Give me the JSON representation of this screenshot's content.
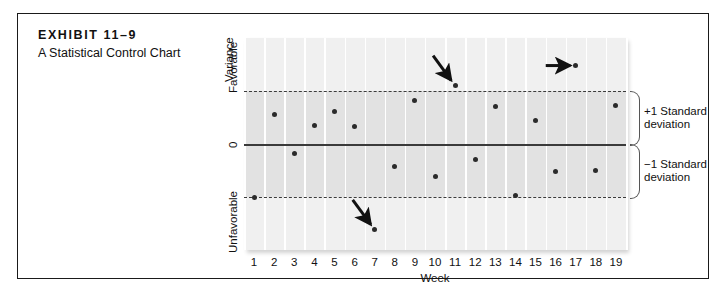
{
  "exhibit": {
    "title": "EXHIBIT 11–9",
    "subtitle": "A Statistical Control Chart"
  },
  "chart_data": {
    "type": "scatter",
    "title": "A Statistical Control Chart",
    "xlabel": "Week",
    "ylabel": "Variance",
    "categories": [
      1,
      2,
      3,
      4,
      5,
      6,
      7,
      8,
      9,
      10,
      11,
      12,
      13,
      14,
      15,
      16,
      17,
      18,
      19
    ],
    "x_tick_labels": [
      "1",
      "2",
      "3",
      "4",
      "5",
      "6",
      "7",
      "8",
      "9",
      "10",
      "11",
      "12",
      "13",
      "14",
      "15",
      "16",
      "17",
      "18",
      "19"
    ],
    "y_tick_labels": [
      "Favorable",
      "0",
      "Unfavorable"
    ],
    "values": [
      -1.0,
      0.55,
      -0.17,
      0.35,
      0.62,
      0.33,
      -1.62,
      -0.42,
      0.82,
      -0.62,
      1.1,
      -0.3,
      0.7,
      -0.98,
      0.45,
      -0.52,
      1.48,
      -0.5,
      0.72
    ],
    "ylim": [
      -2.0,
      2.0
    ],
    "zero_line": 0,
    "upper_control_limit": 1.0,
    "lower_control_limit": -1.0,
    "upper_limit_label": "+1 Standard deviation",
    "lower_limit_label": "−1 Standard deviation",
    "grid": "vertical",
    "legend": "none",
    "annotations": [
      {
        "name": "out-of-control-week-11",
        "target_week": 11,
        "direction": "down-right"
      },
      {
        "name": "out-of-control-week-7",
        "target_week": 7,
        "direction": "down-right"
      },
      {
        "name": "out-of-control-week-17",
        "target_week": 17,
        "direction": "right"
      }
    ]
  },
  "axis": {
    "y_title": "Variance",
    "y_favorable": "Favorable",
    "y_zero": "0",
    "y_unfavorable": "Unfavorable",
    "x_title": "Week"
  },
  "sd_labels": {
    "plus_one_line1": "+1 Standard",
    "plus_one_line2": "deviation",
    "minus_one_line1": "−1 Standard",
    "minus_one_line2": "deviation"
  },
  "colors": {
    "plot_bg": "#f0f0f0",
    "band_bg": "#e2e2e2",
    "line": "#3b3b3b",
    "point": "#2b2b2b",
    "frame": "#1a1a1a"
  }
}
